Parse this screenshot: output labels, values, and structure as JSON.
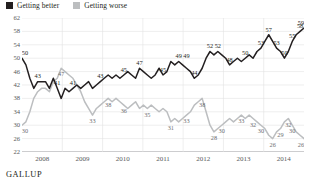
{
  "legend": {
    "items": [
      {
        "label": "Getting better",
        "color": "#231f20",
        "name": "legend-getting-better"
      },
      {
        "label": "Getting worse",
        "color": "#bcbec0",
        "name": "legend-getting-worse"
      }
    ]
  },
  "source": "GALLUP",
  "chart_data": {
    "type": "line",
    "title": "",
    "subtitle": "",
    "xlabel": "",
    "ylabel": "",
    "ylim": [
      22,
      62
    ],
    "yticks": [
      22,
      26,
      30,
      34,
      38,
      42,
      46,
      50,
      54,
      58,
      62
    ],
    "xticks": [
      "2008",
      "2009",
      "2010",
      "2011",
      "2012",
      "2013",
      "2014"
    ],
    "grid": true,
    "legend_position": "top-left",
    "series": [
      {
        "name": "Getting better",
        "color": "#231f20",
        "values": [
          50,
          48,
          44,
          41,
          43,
          43,
          43,
          41,
          44,
          41,
          38,
          41,
          40,
          41,
          42,
          41,
          42,
          43,
          41,
          42,
          43,
          44,
          45,
          44,
          45,
          44,
          45,
          46,
          45,
          44,
          47,
          46,
          45,
          44,
          45,
          47,
          45,
          46,
          49,
          48,
          49,
          48,
          47,
          46,
          44,
          45,
          47,
          50,
          52,
          51,
          52,
          51,
          50,
          48,
          49,
          50,
          49,
          50,
          51,
          50,
          52,
          53,
          55,
          57,
          55,
          53,
          52,
          50,
          52,
          55,
          57,
          58,
          59
        ],
        "labels": [
          {
            "value": 50,
            "index": 0
          },
          {
            "value": 43,
            "index": 4
          },
          {
            "value": 41,
            "index": 9
          },
          {
            "value": 41,
            "index": 13
          },
          {
            "value": 43,
            "index": 20
          },
          {
            "value": 45,
            "index": 26
          },
          {
            "value": 47,
            "index": 30
          },
          {
            "value": 45,
            "index": 36
          },
          {
            "value": 49,
            "index": 40
          },
          {
            "value": 49,
            "index": 42
          },
          {
            "value": 44,
            "index": 44
          },
          {
            "value": 52,
            "index": 48
          },
          {
            "value": 52,
            "index": 50
          },
          {
            "value": 48,
            "index": 53
          },
          {
            "value": 50,
            "index": 57
          },
          {
            "value": 53,
            "index": 61
          },
          {
            "value": 57,
            "index": 63
          },
          {
            "value": 53,
            "index": 65
          },
          {
            "value": 50,
            "index": 67
          },
          {
            "value": 55,
            "index": 69
          },
          {
            "value": 58,
            "index": 71
          },
          {
            "value": 59,
            "index": 72
          }
        ]
      },
      {
        "name": "Getting worse",
        "color": "#bcbec0",
        "values": [
          30,
          31,
          34,
          38,
          40,
          41,
          41,
          40,
          43,
          44,
          47,
          46,
          45,
          44,
          42,
          40,
          37,
          35,
          33,
          35,
          36,
          37,
          38,
          37,
          38,
          37,
          36,
          35,
          36,
          37,
          35,
          36,
          35,
          36,
          35,
          34,
          35,
          34,
          31,
          32,
          31,
          32,
          33,
          34,
          36,
          37,
          38,
          34,
          30,
          28,
          29,
          30,
          31,
          32,
          31,
          32,
          33,
          32,
          33,
          32,
          31,
          30,
          29,
          27,
          26,
          28,
          29,
          31,
          32,
          30,
          28,
          27,
          26
        ],
        "labels": [
          {
            "value": 30,
            "index": 0
          },
          {
            "value": 47,
            "index": 10
          },
          {
            "value": 33,
            "index": 18
          },
          {
            "value": 38,
            "index": 22
          },
          {
            "value": 36,
            "index": 26
          },
          {
            "value": 35,
            "index": 32
          },
          {
            "value": 31,
            "index": 38
          },
          {
            "value": 33,
            "index": 42
          },
          {
            "value": 38,
            "index": 46
          },
          {
            "value": 28,
            "index": 49
          },
          {
            "value": 30,
            "index": 51
          },
          {
            "value": 33,
            "index": 56
          },
          {
            "value": 32,
            "index": 59
          },
          {
            "value": 30,
            "index": 61
          },
          {
            "value": 26,
            "index": 64
          },
          {
            "value": 29,
            "index": 66
          },
          {
            "value": 32,
            "index": 68
          },
          {
            "value": 30,
            "index": 69
          },
          {
            "value": 26,
            "index": 72
          }
        ]
      }
    ]
  }
}
